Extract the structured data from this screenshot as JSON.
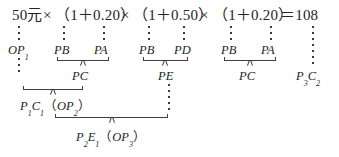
{
  "figure": {
    "type": "annotated-formula-diagram",
    "equation": {
      "full_text": "50元×（1＋0.20）×（1＋0.50）×（1＋0.20）＝108",
      "segments": [
        {
          "id": "base",
          "text": "50元"
        },
        {
          "id": "op1",
          "text": "×"
        },
        {
          "id": "factor1",
          "text": "（1＋0.20）"
        },
        {
          "id": "op2",
          "text": "×"
        },
        {
          "id": "factor2",
          "text": "（1＋0.50）"
        },
        {
          "id": "op3",
          "text": "×"
        },
        {
          "id": "factor3",
          "text": "（1＋0.20）"
        },
        {
          "id": "eq",
          "text": "＝108"
        }
      ]
    },
    "annotation_row_1": [
      {
        "id": "a1",
        "base": "OP",
        "sub": "1"
      },
      {
        "id": "a2",
        "base": "PB",
        "sub": ""
      },
      {
        "id": "a3",
        "base": "PA",
        "sub": ""
      },
      {
        "id": "a4",
        "base": "PB",
        "sub": ""
      },
      {
        "id": "a5",
        "base": "PD",
        "sub": ""
      },
      {
        "id": "a6",
        "base": "PB",
        "sub": ""
      },
      {
        "id": "a7",
        "base": "PA",
        "sub": ""
      }
    ],
    "annotation_row_2": [
      {
        "id": "b1",
        "base": "PC",
        "sub": ""
      },
      {
        "id": "b2",
        "base": "PE",
        "sub": ""
      },
      {
        "id": "b3",
        "base": "PC",
        "sub": ""
      }
    ],
    "right_terminal": {
      "id": "rt",
      "base": "P",
      "sub1": "3",
      "mid": "C",
      "sub2": "2"
    },
    "annotation_row_3": {
      "id": "c1",
      "base": "P",
      "sub1": "1",
      "mid": "C",
      "sub2": "1",
      "paren_open": "（",
      "inner": "OP",
      "inner_sub": "2",
      "paren_close": "）"
    },
    "annotation_row_4": {
      "id": "d1",
      "base": "P",
      "sub1": "2",
      "mid": "E",
      "sub2": "1",
      "paren_open": "（",
      "inner": "OP",
      "inner_sub": "3",
      "paren_close": "）"
    },
    "colors": {
      "ink": "#232323",
      "rule": "#3f3f3f",
      "background": "#ffffff"
    }
  }
}
